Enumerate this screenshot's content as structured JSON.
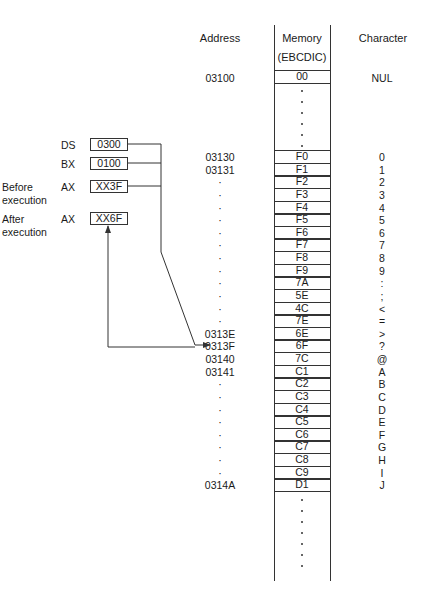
{
  "headers": {
    "address": "Address",
    "memory_line1": "Memory",
    "memory_line2": "(EBCDIC)",
    "character": "Character"
  },
  "top_row": {
    "address": "03100",
    "memory": "00",
    "character": "NUL"
  },
  "rows": [
    {
      "address": "03130",
      "memory": "F0",
      "character": "0"
    },
    {
      "address": "03131",
      "memory": "F1",
      "character": "1"
    },
    {
      "address": "·",
      "memory": "F2",
      "character": "2"
    },
    {
      "address": "·",
      "memory": "F3",
      "character": "3"
    },
    {
      "address": "·",
      "memory": "F4",
      "character": "4"
    },
    {
      "address": "·",
      "memory": "F5",
      "character": "5"
    },
    {
      "address": "·",
      "memory": "F6",
      "character": "6"
    },
    {
      "address": "·",
      "memory": "F7",
      "character": "7"
    },
    {
      "address": "·",
      "memory": "F8",
      "character": "8"
    },
    {
      "address": "·",
      "memory": "F9",
      "character": "9"
    },
    {
      "address": "·",
      "memory": "7A",
      "character": ":"
    },
    {
      "address": "·",
      "memory": "5E",
      "character": ";"
    },
    {
      "address": "·",
      "memory": "4C",
      "character": "<"
    },
    {
      "address": "·",
      "memory": "7E",
      "character": "="
    },
    {
      "address": "0313E",
      "memory": "6E",
      "character": ">"
    },
    {
      "address": "0313F",
      "memory": "6F",
      "character": "?"
    },
    {
      "address": "03140",
      "memory": "7C",
      "character": "@"
    },
    {
      "address": "03141",
      "memory": "C1",
      "character": "A"
    },
    {
      "address": "·",
      "memory": "C2",
      "character": "B"
    },
    {
      "address": "·",
      "memory": "C3",
      "character": "C"
    },
    {
      "address": "·",
      "memory": "C4",
      "character": "D"
    },
    {
      "address": "·",
      "memory": "C5",
      "character": "E"
    },
    {
      "address": "·",
      "memory": "C6",
      "character": "F"
    },
    {
      "address": "·",
      "memory": "C7",
      "character": "G"
    },
    {
      "address": "·",
      "memory": "C8",
      "character": "H"
    },
    {
      "address": "·",
      "memory": "C9",
      "character": "I"
    },
    {
      "address": "0314A",
      "memory": "D1",
      "character": "J"
    }
  ],
  "registers": [
    {
      "label": "DS",
      "sublabel": "",
      "value": "0300"
    },
    {
      "label": "BX",
      "sublabel": "",
      "value": "0100"
    },
    {
      "label": "AX",
      "prefix": "Before",
      "sublabel": "execution",
      "value": "XX3F"
    },
    {
      "label": "AX",
      "prefix": "After",
      "sublabel": "execution",
      "value": "XX6F"
    }
  ],
  "colors": {
    "line": "#333333",
    "text": "#1a1a1a",
    "background": "#ffffff"
  }
}
